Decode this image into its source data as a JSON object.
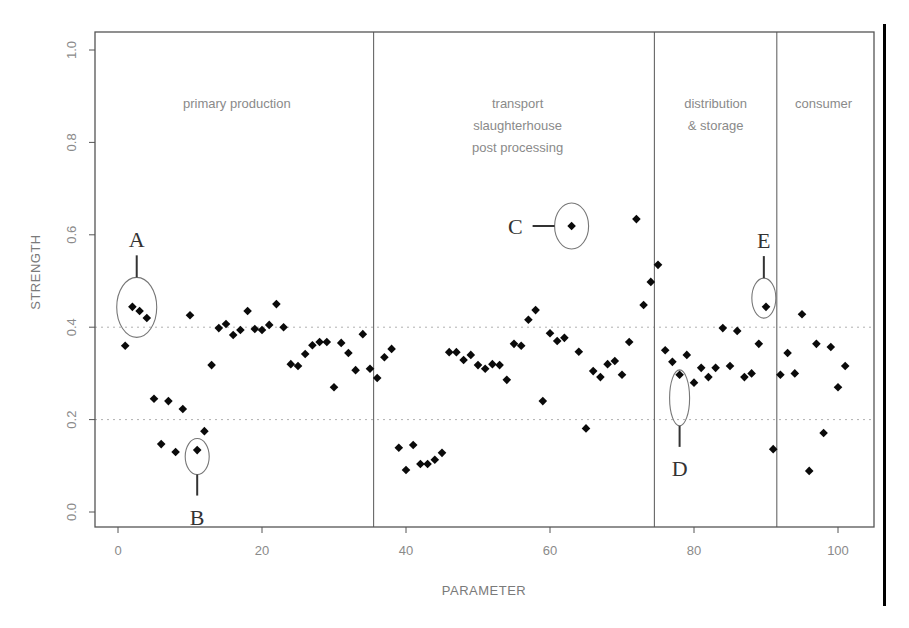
{
  "chart_data": {
    "type": "scatter",
    "title": "",
    "xlabel": "PARAMETER",
    "ylabel": "STRENGTH",
    "xlim": [
      -3,
      105
    ],
    "ylim": [
      -0.03,
      1.04
    ],
    "x_ticks": [
      0,
      20,
      40,
      60,
      80,
      100
    ],
    "x_tick_labels": [
      "0",
      "20",
      "40",
      "60",
      "80",
      "100"
    ],
    "y_ticks": [
      0.0,
      0.2,
      0.4,
      0.6,
      0.8,
      1.0
    ],
    "y_tick_labels": [
      "0.0",
      "0.2",
      "0.4",
      "0.6",
      "0.8",
      "1.0"
    ],
    "reference_lines": [
      0.2,
      0.4
    ],
    "grid": false,
    "legend": null,
    "stage_boundaries": [
      35.5,
      74.5,
      91.5
    ],
    "stages": [
      {
        "lines": [
          "primary production"
        ],
        "x_center": 16.5,
        "y_top": 0.875
      },
      {
        "lines": [
          "transport",
          "slaughterhouse",
          "post processing"
        ],
        "x_center": 55.5,
        "y_top": 0.875
      },
      {
        "lines": [
          "distribution",
          "& storage"
        ],
        "x_center": 83,
        "y_top": 0.875
      },
      {
        "lines": [
          "consumer"
        ],
        "x_center": 98,
        "y_top": 0.875
      }
    ],
    "annotations": [
      {
        "label": "A",
        "cx": 2.6,
        "cy": 0.443,
        "rx_px": 20,
        "ry_px": 30,
        "pointer": "up"
      },
      {
        "label": "B",
        "cx": 11,
        "cy": 0.12,
        "rx_px": 12,
        "ry_px": 18,
        "pointer": "down"
      },
      {
        "label": "C",
        "cx": 63,
        "cy": 0.619,
        "rx_px": 17,
        "ry_px": 23,
        "pointer": "left"
      },
      {
        "label": "D",
        "cx": 78,
        "cy": 0.247,
        "rx_px": 10,
        "ry_px": 28,
        "pointer": "down"
      },
      {
        "label": "E",
        "cx": 89.7,
        "cy": 0.463,
        "rx_px": 12,
        "ry_px": 20,
        "pointer": "up"
      }
    ],
    "series": [
      {
        "name": "strength",
        "points": [
          [
            1,
            0.36
          ],
          [
            2,
            0.444
          ],
          [
            3,
            0.435
          ],
          [
            4,
            0.42
          ],
          [
            5,
            0.245
          ],
          [
            6,
            0.147
          ],
          [
            7,
            0.24
          ],
          [
            8,
            0.13
          ],
          [
            9,
            0.223
          ],
          [
            10,
            0.426
          ],
          [
            11,
            0.134
          ],
          [
            12,
            0.175
          ],
          [
            13,
            0.318
          ],
          [
            14,
            0.398
          ],
          [
            15,
            0.407
          ],
          [
            16,
            0.383
          ],
          [
            17,
            0.394
          ],
          [
            18,
            0.435
          ],
          [
            19,
            0.396
          ],
          [
            20,
            0.394
          ],
          [
            21,
            0.405
          ],
          [
            22,
            0.45
          ],
          [
            23,
            0.4
          ],
          [
            24,
            0.32
          ],
          [
            25,
            0.316
          ],
          [
            26,
            0.342
          ],
          [
            27,
            0.361
          ],
          [
            28,
            0.368
          ],
          [
            29,
            0.368
          ],
          [
            30,
            0.27
          ],
          [
            31,
            0.366
          ],
          [
            32,
            0.344
          ],
          [
            33,
            0.307
          ],
          [
            34,
            0.385
          ],
          [
            35,
            0.31
          ],
          [
            36,
            0.29
          ],
          [
            37,
            0.335
          ],
          [
            38,
            0.353
          ],
          [
            39,
            0.139
          ],
          [
            40,
            0.091
          ],
          [
            41,
            0.145
          ],
          [
            42,
            0.104
          ],
          [
            43,
            0.104
          ],
          [
            44,
            0.113
          ],
          [
            45,
            0.128
          ],
          [
            46,
            0.346
          ],
          [
            47,
            0.346
          ],
          [
            48,
            0.329
          ],
          [
            49,
            0.34
          ],
          [
            50,
            0.318
          ],
          [
            51,
            0.31
          ],
          [
            52,
            0.32
          ],
          [
            53,
            0.318
          ],
          [
            54,
            0.286
          ],
          [
            55,
            0.364
          ],
          [
            56,
            0.36
          ],
          [
            57,
            0.416
          ],
          [
            58,
            0.437
          ],
          [
            59,
            0.24
          ],
          [
            60,
            0.387
          ],
          [
            61,
            0.37
          ],
          [
            62,
            0.377
          ],
          [
            63,
            0.619
          ],
          [
            64,
            0.347
          ],
          [
            65,
            0.181
          ],
          [
            66,
            0.305
          ],
          [
            67,
            0.292
          ],
          [
            68,
            0.32
          ],
          [
            69,
            0.327
          ],
          [
            70,
            0.297
          ],
          [
            71,
            0.368
          ],
          [
            72,
            0.634
          ],
          [
            73,
            0.448
          ],
          [
            74,
            0.498
          ],
          [
            75,
            0.535
          ],
          [
            76,
            0.35
          ],
          [
            77,
            0.325
          ],
          [
            78,
            0.297
          ],
          [
            79,
            0.34
          ],
          [
            80,
            0.28
          ],
          [
            81,
            0.312
          ],
          [
            82,
            0.292
          ],
          [
            83,
            0.312
          ],
          [
            84,
            0.398
          ],
          [
            85,
            0.316
          ],
          [
            86,
            0.392
          ],
          [
            87,
            0.292
          ],
          [
            88,
            0.3
          ],
          [
            89,
            0.364
          ],
          [
            90,
            0.444
          ],
          [
            91,
            0.136
          ],
          [
            92,
            0.297
          ],
          [
            93,
            0.344
          ],
          [
            94,
            0.3
          ],
          [
            95,
            0.428
          ],
          [
            96,
            0.089
          ],
          [
            97,
            0.364
          ],
          [
            98,
            0.171
          ],
          [
            99,
            0.357
          ],
          [
            100,
            0.27
          ],
          [
            101,
            0.316
          ]
        ]
      }
    ]
  }
}
